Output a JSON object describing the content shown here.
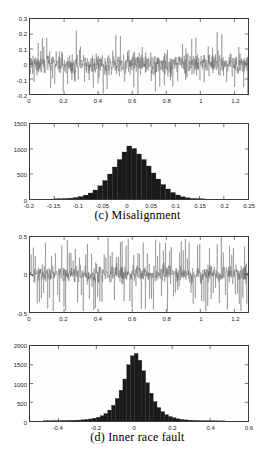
{
  "figure": {
    "background": "#ffffff",
    "axis_color": "#3a3a3a",
    "trace_color": "#555555",
    "bar_color": "#1a1a1a"
  },
  "captions": {
    "c": "(c) Misalignment",
    "d": "(d) Inner race fault"
  },
  "chart_data": [
    {
      "id": "panel-c-signal",
      "type": "line",
      "title": "",
      "xlabel": "",
      "ylabel": "",
      "xlim": [
        0,
        1.28
      ],
      "ylim": [
        -0.2,
        0.3
      ],
      "xticks": [
        0,
        0.2,
        0.4,
        0.6,
        0.8,
        1,
        1.2
      ],
      "xticklabels": [
        "0",
        "0.2",
        "0.4",
        "0.6",
        "0.8",
        "1",
        "1.2"
      ],
      "yticks": [
        -0.2,
        -0.1,
        0,
        0.1,
        0.2,
        0.3
      ],
      "yticklabels": [
        "-0.2",
        "-0.1",
        "0",
        "0.1",
        "0.2",
        "0.3"
      ],
      "grid": false,
      "legend": null,
      "description": "Vibration time waveform, misalignment condition: dense broadband noise band roughly -0.1 to +0.1 with periodic impulse spikes reaching about 0.21 and -0.18",
      "series": [
        {
          "name": "vibration amplitude",
          "noise_band": [
            -0.09,
            0.09
          ],
          "spike_period": 0.026,
          "spike_amplitude_max": 0.21,
          "spike_amplitude_min": -0.18,
          "n_points": 2560
        }
      ]
    },
    {
      "id": "panel-c-hist",
      "type": "bar",
      "title": "",
      "xlabel": "",
      "ylabel": "",
      "xlim": [
        -0.2,
        0.25
      ],
      "ylim": [
        0,
        1500
      ],
      "xticks": [
        -0.2,
        -0.15,
        -0.1,
        -0.05,
        0,
        0.05,
        0.1,
        0.15,
        0.2,
        0.25
      ],
      "xticklabels": [
        "-0.2",
        "-0.15",
        "-0.1",
        "-0.05",
        "0",
        "0.05",
        "0.1",
        "0.15",
        "0.2",
        "0.25"
      ],
      "yticks": [
        0,
        500,
        1000,
        1500
      ],
      "yticklabels": [
        "0",
        "500",
        "1000",
        "1500"
      ],
      "grid": false,
      "legend": null,
      "description": "Amplitude distribution histogram for misalignment: bell-shaped, centred near 0.005, peak count about 1060",
      "peak_value": 1060,
      "peak_center": 0.005,
      "bin_centers": [
        -0.145,
        -0.135,
        -0.125,
        -0.115,
        -0.105,
        -0.095,
        -0.085,
        -0.075,
        -0.065,
        -0.055,
        -0.045,
        -0.035,
        -0.025,
        -0.015,
        -0.005,
        0.005,
        0.015,
        0.025,
        0.035,
        0.045,
        0.055,
        0.065,
        0.075,
        0.085,
        0.095,
        0.105,
        0.115,
        0.125,
        0.135,
        0.145,
        0.155
      ],
      "values": [
        3,
        6,
        10,
        18,
        30,
        48,
        78,
        120,
        180,
        265,
        370,
        500,
        640,
        790,
        940,
        1060,
        1010,
        900,
        790,
        660,
        520,
        400,
        290,
        200,
        130,
        80,
        45,
        25,
        12,
        6,
        3
      ]
    },
    {
      "id": "panel-d-signal",
      "type": "line",
      "title": "",
      "xlabel": "",
      "ylabel": "",
      "xlim": [
        0,
        1.28
      ],
      "ylim": [
        -0.5,
        0.5
      ],
      "xticks": [
        0,
        0.2,
        0.4,
        0.6,
        0.8,
        1,
        1.2
      ],
      "xticklabels": [
        "0",
        "0.2",
        "0.4",
        "0.6",
        "0.8",
        "1",
        "1.2"
      ],
      "yticks": [
        -0.5,
        0,
        0.5
      ],
      "yticklabels": [
        "-0.5",
        "0",
        "0.5"
      ],
      "grid": false,
      "legend": null,
      "description": "Vibration time waveform, inner race fault: noise band roughly -0.15 to +0.15 with frequent large impulsive spikes reaching the full -0.5 to 0.5 range",
      "series": [
        {
          "name": "vibration amplitude",
          "noise_band": [
            -0.14,
            0.14
          ],
          "spike_period": 0.0115,
          "spike_amplitude_max": 0.5,
          "spike_amplitude_min": -0.5,
          "n_points": 2560
        }
      ]
    },
    {
      "id": "panel-d-hist",
      "type": "bar",
      "title": "",
      "xlabel": "",
      "ylabel": "",
      "xlim": [
        -0.55,
        0.6
      ],
      "ylim": [
        0,
        2000
      ],
      "xticks": [
        -0.4,
        -0.2,
        0,
        0.2,
        0.4,
        0.6
      ],
      "xticklabels": [
        "-0.4",
        "-0.2",
        "0",
        "0.2",
        "0.4",
        "0.6"
      ],
      "yticks": [
        0,
        500,
        1000,
        1500,
        2000
      ],
      "yticklabels": [
        "0",
        "500",
        "1000",
        "1500",
        "2000"
      ],
      "grid": false,
      "legend": null,
      "description": "Amplitude distribution histogram for inner race fault: sharp leptokurtic peak centred near 0.01, peak count about 1800, long shallow tails out to +/-0.5",
      "peak_value": 1800,
      "peak_center": 0.01,
      "bin_centers": [
        -0.47,
        -0.45,
        -0.43,
        -0.41,
        -0.39,
        -0.37,
        -0.35,
        -0.33,
        -0.31,
        -0.29,
        -0.27,
        -0.25,
        -0.23,
        -0.21,
        -0.19,
        -0.17,
        -0.15,
        -0.13,
        -0.11,
        -0.09,
        -0.07,
        -0.05,
        -0.03,
        -0.01,
        0.01,
        0.03,
        0.05,
        0.07,
        0.09,
        0.11,
        0.13,
        0.15,
        0.17,
        0.19,
        0.21,
        0.23,
        0.25,
        0.27,
        0.29,
        0.31,
        0.33,
        0.35,
        0.37,
        0.39,
        0.41,
        0.43,
        0.45,
        0.47
      ],
      "values": [
        4,
        5,
        6,
        8,
        9,
        11,
        13,
        16,
        20,
        25,
        32,
        42,
        55,
        75,
        100,
        140,
        200,
        290,
        420,
        600,
        820,
        1120,
        1500,
        1740,
        1800,
        1620,
        1340,
        1020,
        740,
        520,
        360,
        250,
        170,
        120,
        85,
        60,
        42,
        30,
        22,
        16,
        12,
        9,
        7,
        6,
        5,
        4,
        3,
        3
      ]
    }
  ]
}
